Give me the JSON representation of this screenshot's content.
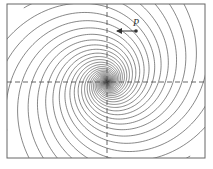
{
  "diagram": {
    "type": "spiral-phase-portrait",
    "point_label": "P",
    "colors": {
      "frame": "#666666",
      "curves": "#555555",
      "axes": "#555555",
      "arrow": "#333333",
      "point": "#333333"
    },
    "frame": {
      "x": 7,
      "y": 4,
      "width": 198,
      "height": 154
    },
    "center": {
      "x": 107,
      "y": 82
    },
    "point": {
      "x": 136,
      "y": 31
    },
    "arrow_tip": {
      "x": 114,
      "y": 31
    },
    "spiral_count": 16,
    "axes": {
      "horizontal_dashed": true,
      "vertical_dashed": true
    }
  }
}
